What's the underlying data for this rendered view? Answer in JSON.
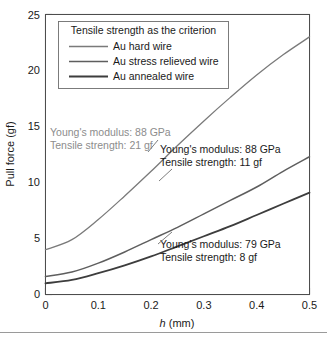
{
  "chart_data": {
    "type": "line",
    "title": "",
    "xlabel": "h (mm)",
    "xlabel_italic_part": "h",
    "xlabel_rest": " (mm)",
    "ylabel": "Pull force (gf)",
    "xlim": [
      0,
      0.5
    ],
    "ylim": [
      0,
      25
    ],
    "xticks": [
      0,
      0.1,
      0.2,
      0.3,
      0.4,
      0.5
    ],
    "xtick_labels": [
      "0",
      "0.1",
      "0.2",
      "0.3",
      "0.4",
      "0.5"
    ],
    "yticks": [
      0,
      5,
      10,
      15,
      20,
      25
    ],
    "ytick_labels": [
      "0",
      "5",
      "10",
      "15",
      "20",
      "25"
    ],
    "grid": false,
    "legend_position": "upper-left-inside",
    "legend_title": "Tensile strength as the criterion",
    "x": [
      0,
      0.05,
      0.1,
      0.15,
      0.2,
      0.25,
      0.3,
      0.35,
      0.4,
      0.45,
      0.5
    ],
    "series": [
      {
        "name": "Au hard wire",
        "color": "#7a7a7a",
        "width": 1.3,
        "values": [
          4.0,
          4.9,
          6.7,
          8.8,
          11.0,
          13.3,
          15.5,
          17.6,
          19.6,
          21.4,
          23.0
        ]
      },
      {
        "name": "Au stress relieved wire",
        "color": "#5e5e5e",
        "width": 1.5,
        "values": [
          1.6,
          2.0,
          2.8,
          3.8,
          4.9,
          6.0,
          7.2,
          8.4,
          9.6,
          11.0,
          12.3
        ]
      },
      {
        "name": "Au annealed wire",
        "color": "#3d3d3d",
        "width": 1.8,
        "values": [
          1.0,
          1.3,
          1.9,
          2.6,
          3.4,
          4.3,
          5.2,
          6.1,
          7.1,
          8.1,
          9.1
        ]
      }
    ],
    "annotations": [
      {
        "id": "hard-wire",
        "line1": "Young's modulus: 88 GPa",
        "line2": "Tensile strength: 21 gf",
        "color": "#8c8c8c"
      },
      {
        "id": "stress-relieved-wire",
        "line1": "Young's modulus: 88 GPa",
        "line2": "Tensile strength: 11 gf",
        "color": "#1a1a1a"
      },
      {
        "id": "annealed-wire",
        "line1": "Young's modulus: 79 GPa",
        "line2": "Tensile strength: 8 gf",
        "color": "#1a1a1a"
      }
    ]
  }
}
